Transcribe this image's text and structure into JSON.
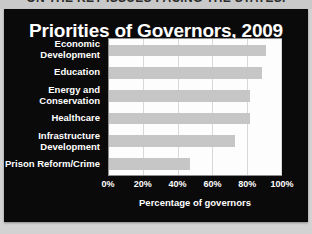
{
  "kicker": {
    "text": "ON THE KEY ISSUES FACING THE STATES."
  },
  "chart_data": {
    "type": "bar",
    "orientation": "horizontal",
    "title": "Priorities of Governors, 2009",
    "xlabel": "Percentage of governors",
    "ylabel": "",
    "categories": [
      "Economic Development",
      "Education",
      "Energy and Conservation",
      "Healthcare",
      "Infrastructure Development",
      "Prison Reform/Crime"
    ],
    "category_lines": [
      [
        "Economic",
        "Development"
      ],
      [
        "Education"
      ],
      [
        "Energy and",
        "Conservation"
      ],
      [
        "Healthcare"
      ],
      [
        "Infrastructure",
        "Development"
      ],
      [
        "Prison Reform/Crime"
      ]
    ],
    "values": [
      91,
      89,
      82,
      82,
      73,
      47
    ],
    "xlim": [
      0,
      100
    ],
    "xticks": [
      0,
      20,
      40,
      60,
      80,
      100
    ],
    "xtick_labels": [
      "0%",
      "20%",
      "40%",
      "60%",
      "80%",
      "100%"
    ],
    "grid": true,
    "legend": false,
    "bar_color": "#c6c6c6",
    "plot_background": "#fdfdfd",
    "panel_background": "#0a0a0a",
    "text_color": "#ffffff"
  }
}
